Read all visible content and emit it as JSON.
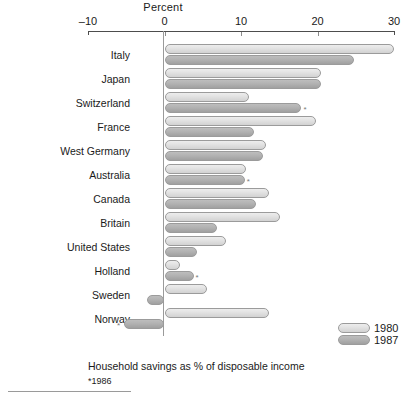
{
  "chart_data": {
    "type": "bar",
    "orientation": "horizontal",
    "title": "",
    "xlabel": "Percent",
    "ylabel": "",
    "xlim": [
      -10,
      30
    ],
    "xticks": [
      -10,
      0,
      10,
      20,
      30
    ],
    "xtick_labels": [
      "–10",
      "0",
      "10",
      "20",
      "30"
    ],
    "grid": false,
    "legend_position": "bottom-right",
    "categories": [
      "Italy",
      "Japan",
      "Switzerland",
      "France",
      "West Germany",
      "Australia",
      "Canada",
      "Britain",
      "United States",
      "Holland",
      "Sweden",
      "Norway"
    ],
    "series": [
      {
        "name": "1980",
        "color": "#e4e4e4",
        "values": [
          30.0,
          20.5,
          11.0,
          19.8,
          13.3,
          10.6,
          13.6,
          15.1,
          8.0,
          2.0,
          5.5,
          13.7
        ]
      },
      {
        "name": "1987",
        "color": "#b2b2b2",
        "values": [
          24.8,
          20.5,
          17.9,
          11.7,
          12.9,
          10.5,
          12.0,
          6.8,
          4.3,
          3.8,
          -2.3,
          -5.3
        ]
      }
    ],
    "annotations": [
      {
        "category": "Switzerland",
        "series": "1987",
        "marker": "*"
      },
      {
        "category": "Australia",
        "series": "1987",
        "marker": "*"
      },
      {
        "category": "Holland",
        "series": "1987",
        "marker": "*"
      },
      {
        "category": "Norway",
        "series": "1987",
        "marker": "*"
      }
    ],
    "caption": "Household savings as % of disposable income",
    "footnote": "*1986"
  },
  "legend": {
    "items": [
      {
        "label": "1980"
      },
      {
        "label": "1987"
      }
    ]
  }
}
